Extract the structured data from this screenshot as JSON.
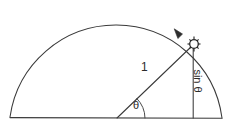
{
  "diagram": {
    "type": "geometry",
    "background_color": "#ffffff",
    "line_color": "#3a3a3a",
    "text_color": "#2b2b2b",
    "labels": {
      "radius": "1",
      "angle": "θ",
      "vertical": "sin θ"
    },
    "geometry": {
      "center": {
        "x": 117,
        "y": 118
      },
      "radius": 107,
      "point_on_arc": {
        "x": 194,
        "y": 44
      },
      "arc_apex": {
        "x": 115,
        "y": 10
      },
      "arc_start": {
        "x": 10,
        "y": 117
      },
      "arc_end": {
        "x": 222,
        "y": 118
      },
      "baseline_y": 118,
      "vertical_line_x": 193,
      "angle_degrees": 44
    },
    "elements": {
      "arc": "semicircular-arc",
      "baseline": "horizontal-diameter",
      "radius_line": "radius-segment",
      "vertical_line": "sine-segment",
      "angle_arc": "angle-indicator",
      "arrowhead": "direction-arrow",
      "node": "point-marker"
    }
  }
}
